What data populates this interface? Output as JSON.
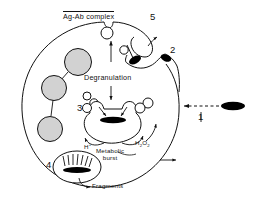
{
  "figure": {
    "type": "biological-diagram",
    "background_color": "#ffffff",
    "line_color": "#111111",
    "granule_fill": "#d2d2d2",
    "bacterium_fill": "#000000"
  },
  "labels": {
    "ag_ab_complex": "Ag-Ab complex",
    "degranulation": "Degranulation",
    "metabolic_burst_line1": "Metabolic",
    "metabolic_burst_line2": "burst",
    "fragments": "Fragments",
    "h_plus": "H",
    "h_plus_super": "+",
    "h2o2_h": "H",
    "h2o2_2a": "2",
    "h2o2_o": "O",
    "h2o2_2b": "2"
  },
  "step_numbers": {
    "step1": "1",
    "step2": "2",
    "step3": "3",
    "step4": "4",
    "step5": "5"
  },
  "elements": {
    "cell": {
      "name": "phagocytic-cell",
      "cx": 97,
      "cy": 104,
      "r": 83
    },
    "granules": [
      {
        "cx": 78,
        "cy": 62,
        "r": 13
      },
      {
        "cx": 54,
        "cy": 88,
        "r": 12
      },
      {
        "cx": 50,
        "cy": 128,
        "r": 12
      }
    ],
    "free_bacterium": {
      "cx": 232,
      "cy": 107,
      "rx": 12,
      "ry": 4
    },
    "engulfed_bacteria": [
      {
        "cx": 135,
        "cy": 60,
        "rx": 6,
        "ry": 3.5,
        "rot": -25
      },
      {
        "cx": 165,
        "cy": 57,
        "rx": 5,
        "ry": 3.5,
        "rot": 20
      }
    ],
    "phagosome": {
      "cx": 113,
      "cy": 118,
      "rx": 30,
      "ry": 22
    },
    "phagosome_bacterium": {
      "cx": 113,
      "cy": 120,
      "rx": 13,
      "ry": 3
    },
    "phagolysosome": {
      "cx": 77,
      "cy": 167,
      "rx": 24,
      "ry": 16
    },
    "phagolysosome_bacterium": {
      "cx": 77,
      "cy": 170,
      "rx": 14,
      "ry": 3
    },
    "free_vesicles": [
      {
        "cx": 87,
        "cy": 95,
        "r": 4
      },
      {
        "cx": 94,
        "cy": 101,
        "r": 4
      },
      {
        "cx": 146,
        "cy": 102,
        "r": 5
      },
      {
        "cx": 106,
        "cy": 33,
        "r": 6
      },
      {
        "cx": 123,
        "cy": 50,
        "r": 4
      }
    ]
  }
}
